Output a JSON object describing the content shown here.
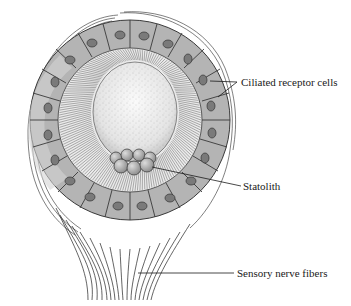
{
  "diagram": {
    "labels": {
      "ciliated_receptor_cells": "Ciliated receptor cells",
      "statolith": "Statolith",
      "sensory_nerve_fibers": "Sensory nerve fibers"
    },
    "colors": {
      "background": "#ffffff",
      "cell_fill": "#b4b4b4",
      "cell_outline": "#3a3a3a",
      "nucleus_fill": "#7a7a7a",
      "cilia_zone": "#e6e6e6",
      "lumen_fill": "#f2f2f2",
      "statolith_fill": "#a8a8a8",
      "line": "#1a1a1a"
    }
  }
}
